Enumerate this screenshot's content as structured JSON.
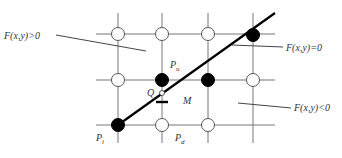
{
  "diagram": {
    "labels": {
      "region_positive": "F(x,y)>0",
      "region_zero": "F(x,y)=0",
      "region_negative": "F(x,y)<0",
      "point_i": "P",
      "point_i_sub": "i",
      "point_u": "P",
      "point_u_sub": "u",
      "point_d": "P",
      "point_d_sub": "d",
      "point_q": "Q",
      "point_m": "M"
    },
    "grid": {
      "columns_x": [
        118,
        162,
        208,
        253
      ],
      "rows_y": [
        34,
        80,
        125
      ]
    },
    "pixels": [
      {
        "col": 0,
        "row": 0,
        "state": "open"
      },
      {
        "col": 1,
        "row": 0,
        "state": "open"
      },
      {
        "col": 2,
        "row": 0,
        "state": "open"
      },
      {
        "col": 3,
        "row": 0,
        "state": "filled"
      },
      {
        "col": 0,
        "row": 1,
        "state": "open"
      },
      {
        "col": 1,
        "row": 1,
        "state": "filled"
      },
      {
        "col": 2,
        "row": 1,
        "state": "filled"
      },
      {
        "col": 3,
        "row": 1,
        "state": "open"
      },
      {
        "col": 0,
        "row": 2,
        "state": "filled"
      },
      {
        "col": 1,
        "row": 2,
        "state": "open"
      },
      {
        "col": 2,
        "row": 2,
        "state": "open"
      }
    ],
    "colors": {
      "line": "#000000",
      "grid": "#777777",
      "filled_pixel": "#000000",
      "open_pixel": "#ffffff"
    }
  }
}
